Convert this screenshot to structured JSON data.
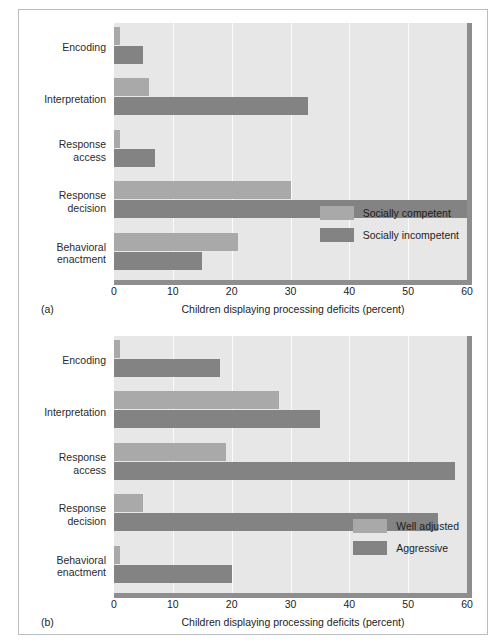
{
  "figure": {
    "panels": [
      {
        "tag": "(a)",
        "xlabel": "Children displaying processing deficits (percent)",
        "xticks": [
          "0",
          "10",
          "20",
          "30",
          "40",
          "50",
          "60"
        ],
        "categories": [
          "Encoding",
          "Interpretation",
          "Response\naccess",
          "Response\ndecision",
          "Behavioral\nenactment"
        ],
        "legend": [
          {
            "label": "Socially competent",
            "color": "#a9a9a9"
          },
          {
            "label": "Socially incompetent",
            "color": "#838383"
          }
        ]
      },
      {
        "tag": "(b)",
        "xlabel": "Children displaying processing deficits (percent)",
        "xticks": [
          "0",
          "10",
          "20",
          "30",
          "40",
          "50",
          "60"
        ],
        "categories": [
          "Encoding",
          "Interpretation",
          "Response\naccess",
          "Response\ndecision",
          "Behavioral\nenactment"
        ],
        "legend": [
          {
            "label": "Well adjusted",
            "color": "#a9a9a9"
          },
          {
            "label": "Aggressive",
            "color": "#838383"
          }
        ]
      }
    ]
  },
  "chart_data": [
    {
      "type": "bar",
      "orientation": "horizontal",
      "panel": "(a)",
      "title": "",
      "xlabel": "Children displaying processing deficits (percent)",
      "ylabel": "",
      "xlim": [
        0,
        60
      ],
      "xticks": [
        0,
        10,
        20,
        30,
        40,
        50,
        60
      ],
      "grid": true,
      "legend_position": "inside-bottom-right",
      "categories": [
        "Encoding",
        "Interpretation",
        "Response access",
        "Response decision",
        "Behavioral enactment"
      ],
      "series": [
        {
          "name": "Socially competent",
          "color": "#a9a9a9",
          "values": [
            1,
            6,
            1,
            30,
            21
          ]
        },
        {
          "name": "Socially incompetent",
          "color": "#838383",
          "values": [
            5,
            33,
            7,
            60,
            15
          ]
        }
      ]
    },
    {
      "type": "bar",
      "orientation": "horizontal",
      "panel": "(b)",
      "title": "",
      "xlabel": "Children displaying processing deficits (percent)",
      "ylabel": "",
      "xlim": [
        0,
        60
      ],
      "xticks": [
        0,
        10,
        20,
        30,
        40,
        50,
        60
      ],
      "grid": true,
      "legend_position": "inside-bottom-right",
      "categories": [
        "Encoding",
        "Interpretation",
        "Response access",
        "Response decision",
        "Behavioral enactment"
      ],
      "series": [
        {
          "name": "Well adjusted",
          "color": "#a9a9a9",
          "values": [
            1,
            28,
            19,
            5,
            1
          ]
        },
        {
          "name": "Aggressive",
          "color": "#838383",
          "values": [
            18,
            35,
            58,
            55,
            20
          ]
        }
      ]
    }
  ]
}
